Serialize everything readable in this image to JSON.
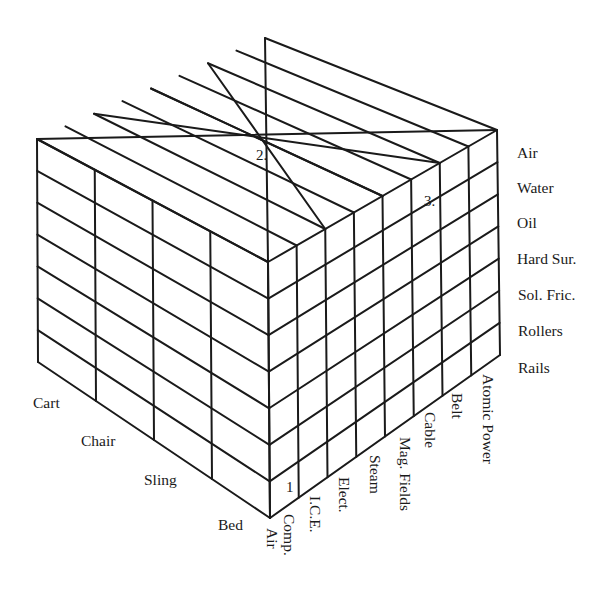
{
  "diagram": {
    "type": "morphological-box",
    "line_color": "#1a1a1a",
    "background": "#ffffff",
    "vertices": {
      "top": [
        265,
        38
      ],
      "left_top": [
        37,
        139
      ],
      "right_top": [
        497,
        130
      ],
      "front_top": [
        268,
        262
      ],
      "left_bottom": [
        38,
        362
      ],
      "right_bottom": [
        500,
        355
      ],
      "front_bottom": [
        270,
        518
      ]
    },
    "grid": {
      "left_columns": 4,
      "right_columns": 8,
      "rows": 7
    }
  },
  "axes": {
    "support_medium": {
      "title": "",
      "labels": [
        "Air",
        "Water",
        "Oil",
        "Hard Sur.",
        "Sol. Fric.",
        "Rollers",
        "Rails"
      ]
    },
    "vehicle_type": {
      "title": "",
      "labels": [
        "Cart",
        "Chair",
        "Sling",
        "Bed"
      ]
    },
    "power_source": {
      "title": "",
      "labels": [
        "Comp. Air",
        "I.C.E.",
        "Elect.",
        "Steam",
        "Mag. Fields",
        "Cable",
        "Belt",
        "Atomic Power"
      ]
    }
  },
  "markers": [
    {
      "text": "1",
      "face": "right",
      "x": 288,
      "y": 492
    },
    {
      "text": "2.",
      "face": "top",
      "x": 262,
      "y": 160
    },
    {
      "text": "3.",
      "face": "right",
      "x": 432,
      "y": 205
    }
  ]
}
